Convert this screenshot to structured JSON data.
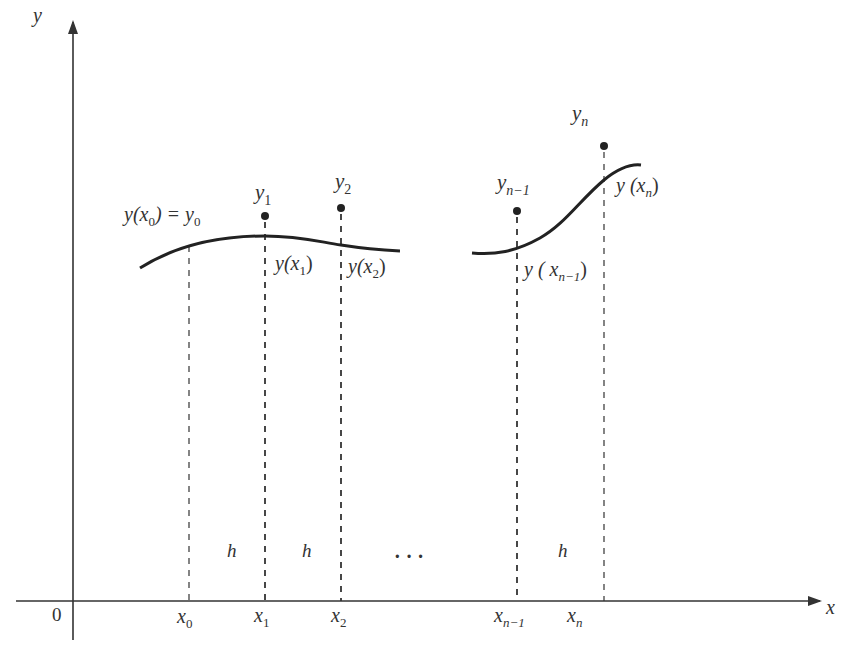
{
  "diagram": {
    "axes": {
      "x_label": "x",
      "y_label": "y",
      "origin_label": "0"
    },
    "grid_points": [
      {
        "x_label": "x",
        "x_sub": "0",
        "px": 189
      },
      {
        "x_label": "x",
        "x_sub": "1",
        "px": 265
      },
      {
        "x_label": "x",
        "x_sub": "2",
        "px": 341
      },
      {
        "x_label": "x",
        "x_sub": "n−1",
        "px": 517
      },
      {
        "x_label": "x",
        "x_sub": "n",
        "px": 604
      }
    ],
    "step_labels": [
      "h",
      "h",
      "h"
    ],
    "ellipsis": "· · ·",
    "approx_points": [
      {
        "label": "y",
        "sub": "1",
        "cx": 265,
        "cy": 216
      },
      {
        "label": "y",
        "sub": "2",
        "cx": 341,
        "cy": 208
      },
      {
        "label": "y",
        "sub": "n−1",
        "cx": 517,
        "cy": 211
      },
      {
        "label": "y",
        "sub": "n",
        "cx": 604,
        "cy": 146
      }
    ],
    "curve_labels": {
      "initial": {
        "lhs": "y(x",
        "lhs_sub": "0",
        "mid": ") = y",
        "rhs_sub": "0"
      },
      "y_x1": {
        "pre": "y(x",
        "sub": "1",
        "post": ")"
      },
      "y_x2": {
        "pre": "y(x",
        "sub": "2",
        "post": ")"
      },
      "y_xn1": {
        "pre": "y ( x",
        "sub": "n−1",
        "post": ")"
      },
      "y_xn": {
        "pre": "y (x",
        "sub": "n",
        "post": ")"
      }
    },
    "colors": {
      "ink": "#333333",
      "curve": "#222222",
      "background": "#ffffff"
    }
  }
}
